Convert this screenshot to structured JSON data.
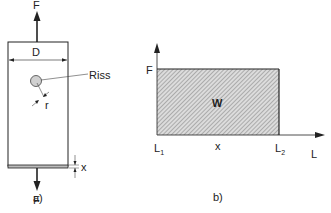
{
  "panel_a": {
    "caption": "a)",
    "force_top": "F",
    "force_bottom": "F",
    "width_label": "D",
    "crack_label": "Riss",
    "radius_label": "r",
    "thickness_label": "x"
  },
  "panel_b": {
    "caption": "b)",
    "y_axis_label": "F",
    "x_axis_label": "L",
    "area_label": "W",
    "x_start": "L",
    "x_start_sub": "1",
    "x_mid": "x",
    "x_end": "L",
    "x_end_sub": "2"
  },
  "colors": {
    "line": "#222222",
    "hatch_bg": "#d8d8d8",
    "hatch_line": "#888888",
    "crack_fill": "#d0d0d0"
  }
}
